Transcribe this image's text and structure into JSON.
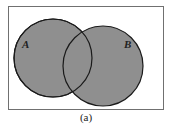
{
  "diagram": {
    "type": "venn",
    "universe": {
      "x": 8,
      "y": 6,
      "width": 155,
      "height": 103,
      "stroke": "#666666"
    },
    "sets": [
      {
        "label": "A",
        "cx": 53,
        "cy": 58,
        "r": 39,
        "label_x": 24,
        "label_y": 48
      },
      {
        "label": "B",
        "cx": 103,
        "cy": 66,
        "r": 40,
        "label_x": 129,
        "label_y": 48
      }
    ],
    "fill": "#8f8f8f",
    "stroke": "#1a1a1a",
    "caption": "(a)"
  }
}
